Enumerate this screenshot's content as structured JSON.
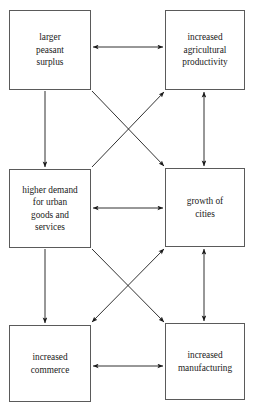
{
  "diagram": {
    "type": "flow-diagram",
    "title": "",
    "background_color": "#ffffff",
    "box_border_color": "#5a5a5a",
    "arrow_color": "#1a1a1a",
    "nodes": [
      {
        "id": "peasant-surplus",
        "label": "larger\npeasant\nsurplus",
        "x": 9,
        "y": 10,
        "width": 82,
        "height": 80
      },
      {
        "id": "agricultural-productivity",
        "label": "increased\nagricultural\nproductivity",
        "x": 165,
        "y": 10,
        "width": 80,
        "height": 80
      },
      {
        "id": "urban-demand",
        "label": "higher demand\nfor urban\ngoods and\nservices",
        "x": 9,
        "y": 169,
        "width": 82,
        "height": 79
      },
      {
        "id": "growth-of-cities",
        "label": "growth of\ncities",
        "x": 165,
        "y": 168,
        "width": 80,
        "height": 79
      },
      {
        "id": "increased-commerce",
        "label": "increased\ncommerce",
        "x": 9,
        "y": 325,
        "width": 82,
        "height": 77
      },
      {
        "id": "increased-manufacturing",
        "label": "increased\nmanufacturing",
        "x": 165,
        "y": 323,
        "width": 80,
        "height": 77
      }
    ],
    "edges": [
      {
        "id": "surplus-to-productivity",
        "from": "peasant-surplus",
        "to": "agricultural-productivity",
        "heads": "both",
        "x1": 93,
        "y1": 47,
        "x2": 163,
        "y2": 47
      },
      {
        "id": "surplus-to-urban-demand",
        "from": "peasant-surplus",
        "to": "urban-demand",
        "heads": "end",
        "x1": 45,
        "y1": 91,
        "x2": 45,
        "y2": 167
      },
      {
        "id": "surplus-to-growth-of-cities",
        "from": "peasant-surplus",
        "to": "growth-of-cities",
        "heads": "end",
        "x1": 92,
        "y1": 91,
        "x2": 164,
        "y2": 166
      },
      {
        "id": "urban-demand-to-productivity",
        "from": "urban-demand",
        "to": "agricultural-productivity",
        "heads": "end",
        "x1": 92,
        "y1": 167,
        "x2": 164,
        "y2": 92
      },
      {
        "id": "productivity-to-growth-of-cities",
        "from": "agricultural-productivity",
        "to": "growth-of-cities",
        "heads": "both",
        "x1": 204,
        "y1": 92,
        "x2": 204,
        "y2": 166
      },
      {
        "id": "urban-demand-to-growth-of-cities",
        "from": "urban-demand",
        "to": "growth-of-cities",
        "heads": "both",
        "x1": 93,
        "y1": 208,
        "x2": 163,
        "y2": 208
      },
      {
        "id": "urban-demand-to-commerce",
        "from": "urban-demand",
        "to": "increased-commerce",
        "heads": "end",
        "x1": 45,
        "y1": 249,
        "x2": 45,
        "y2": 323
      },
      {
        "id": "urban-demand-to-manufacturing",
        "from": "urban-demand",
        "to": "increased-manufacturing",
        "heads": "end",
        "x1": 92,
        "y1": 249,
        "x2": 164,
        "y2": 322
      },
      {
        "id": "growth-of-cities-to-commerce",
        "from": "growth-of-cities",
        "to": "increased-commerce",
        "heads": "both",
        "x1": 164,
        "y1": 249,
        "x2": 92,
        "y2": 322
      },
      {
        "id": "growth-of-cities-to-manufacturing",
        "from": "growth-of-cities",
        "to": "increased-manufacturing",
        "heads": "both",
        "x1": 204,
        "y1": 249,
        "x2": 204,
        "y2": 321
      },
      {
        "id": "commerce-to-manufacturing",
        "from": "increased-commerce",
        "to": "increased-manufacturing",
        "heads": "both",
        "x1": 93,
        "y1": 366,
        "x2": 163,
        "y2": 366
      }
    ]
  }
}
